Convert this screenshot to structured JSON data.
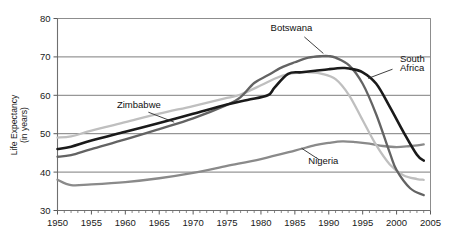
{
  "chart_data": {
    "type": "line",
    "title": "",
    "xlabel": "",
    "ylabel": "Life Expectancy (in years)",
    "ylabel_line1": "Life Expectancy",
    "ylabel_line2": "(in years)",
    "xlim": [
      1950,
      2005
    ],
    "ylim": [
      30,
      80
    ],
    "x_ticks": [
      1950,
      1955,
      1960,
      1965,
      1970,
      1975,
      1980,
      1985,
      1990,
      1995,
      2000,
      2005
    ],
    "y_ticks": [
      30,
      40,
      50,
      60,
      70,
      80
    ],
    "x_minor_tick_interval": 1,
    "grid": "horizontal",
    "legend": "inline-annotations",
    "series": [
      {
        "name": "Zimbabwe",
        "color": "#bfbfbf",
        "label_x": 1962,
        "label_y": 56.6,
        "x": [
          1950,
          1952,
          1955,
          1960,
          1965,
          1970,
          1975,
          1977,
          1980,
          1982,
          1984,
          1986,
          1987,
          1989,
          1991,
          1993,
          1995,
          1997,
          1999,
          2001,
          2003,
          2004
        ],
        "values": [
          49.0,
          49.3,
          50.8,
          53.0,
          55.2,
          57.2,
          59.3,
          60.2,
          62.6,
          64.3,
          65.5,
          66.0,
          66.0,
          65.6,
          64.2,
          60.0,
          53.5,
          47.0,
          42.0,
          39.2,
          38.2,
          38.0
        ]
      },
      {
        "name": "South Africa",
        "color": "#1a1a1a",
        "label_x": 2000.5,
        "label_y": 68.6,
        "label_line1": "South",
        "label_line2": "Africa",
        "x": [
          1950,
          1952,
          1955,
          1960,
          1965,
          1970,
          1975,
          1978,
          1981,
          1982,
          1984,
          1986,
          1988,
          1990,
          1992,
          1993,
          1995,
          1997,
          1999,
          2001,
          2003,
          2004
        ],
        "values": [
          46.0,
          46.6,
          48.2,
          50.5,
          52.8,
          55.2,
          57.6,
          58.8,
          60.0,
          62.0,
          65.6,
          66.0,
          66.4,
          66.8,
          67.1,
          67.0,
          66.0,
          63.0,
          57.0,
          50.5,
          44.5,
          43.0
        ]
      },
      {
        "name": "Botswana",
        "color": "#636363",
        "label_x": 1984.5,
        "label_y": 76.8,
        "x": [
          1950,
          1952,
          1955,
          1960,
          1965,
          1970,
          1975,
          1977,
          1979,
          1981,
          1983,
          1985,
          1987,
          1989,
          1990,
          1991,
          1993,
          1995,
          1997,
          1999,
          2000,
          2002,
          2004
        ],
        "values": [
          44.0,
          44.4,
          46.0,
          48.5,
          51.2,
          54.0,
          57.5,
          59.5,
          63.2,
          65.2,
          67.2,
          68.6,
          69.8,
          70.2,
          70.2,
          69.8,
          67.8,
          63.0,
          55.0,
          45.0,
          40.5,
          35.8,
          34.0
        ]
      },
      {
        "name": "Nigeria",
        "color": "#8a8a8a",
        "label_x": 1989.2,
        "label_y": 42.2,
        "x": [
          1950,
          1952,
          1955,
          1960,
          1965,
          1970,
          1975,
          1980,
          1985,
          1988,
          1990,
          1992,
          1994,
          1996,
          1998,
          2000,
          2002,
          2004
        ],
        "values": [
          38.0,
          36.6,
          36.8,
          37.4,
          38.4,
          39.8,
          41.6,
          43.4,
          45.6,
          47.0,
          47.6,
          48.0,
          47.8,
          47.4,
          46.8,
          46.5,
          46.8,
          47.2
        ]
      }
    ]
  },
  "annotations": {
    "zimbabwe_label": "Zimbabwe",
    "botswana_label": "Botswana",
    "nigeria_label": "Nigeria",
    "south_africa_label_line1": "South",
    "south_africa_label_line2": "Africa"
  }
}
